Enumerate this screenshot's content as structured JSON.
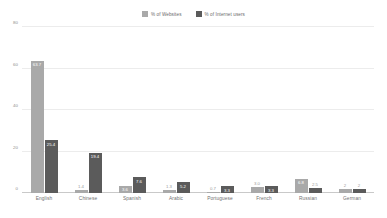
{
  "chart_data": {
    "type": "bar",
    "title": "",
    "subtitle": "",
    "xlabel": "",
    "ylabel": "",
    "ylim": [
      0,
      80
    ],
    "yticks": [
      "0",
      "20",
      "40",
      "60",
      "80"
    ],
    "ytick_values": [
      0,
      20,
      40,
      60,
      80
    ],
    "grid": true,
    "legend_position": "top-center",
    "categories": [
      "English",
      "Chinese",
      "Spanish",
      "Arabic",
      "Portuguese",
      "French",
      "Russian",
      "German"
    ],
    "series": [
      {
        "name": "% of Websites",
        "color": "#a9a9a9",
        "values": [
          63.7,
          1.4,
          3.6,
          1.3,
          0.7,
          3.0,
          6.8,
          2
        ],
        "labels": [
          "63.7",
          "1.4",
          "3.6",
          "1.3",
          "0.7",
          "3.0",
          "6.8",
          "2"
        ],
        "label_positions": [
          "inside",
          "outside",
          "inside",
          "outside",
          "outside",
          "outside",
          "inside",
          "outside"
        ]
      },
      {
        "name": "% of Internet users",
        "color": "#5b5b5b",
        "values": [
          25.4,
          19.4,
          7.6,
          5.2,
          3.3,
          3.3,
          2.5,
          2
        ],
        "labels": [
          "25.4",
          "19.4",
          "7.6",
          "5.2",
          "3.3",
          "3.3",
          "2.5",
          "2"
        ],
        "label_positions": [
          "inside",
          "inside",
          "inside",
          "inside",
          "inside",
          "inside",
          "outside",
          "outside"
        ]
      }
    ]
  },
  "legend": {
    "items": [
      {
        "label": "% of Websites",
        "color": "#a9a9a9"
      },
      {
        "label": "% of Internet users",
        "color": "#5b5b5b"
      }
    ]
  }
}
